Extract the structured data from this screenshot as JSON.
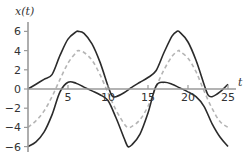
{
  "chart_data": {
    "type": "line",
    "title": "",
    "xlabel": "t",
    "ylabel": "x(t)",
    "xlim": [
      0,
      25
    ],
    "ylim": [
      -6,
      6
    ],
    "x_ticks": [
      5,
      10,
      15,
      20,
      25
    ],
    "y_ticks": [
      6,
      4,
      2,
      0,
      -2,
      -4,
      -6
    ],
    "grid": false,
    "legend": "none",
    "series": [
      {
        "name": "upper envelope",
        "style": "solid",
        "color": "#2b2b2b",
        "x": [
          0,
          1,
          2,
          3,
          4,
          5,
          6,
          6.3,
          7,
          8,
          9,
          10,
          10.5,
          11,
          12,
          13,
          14,
          15,
          16,
          17,
          18,
          18.6,
          19,
          20,
          21,
          22,
          22.5,
          23,
          24,
          25
        ],
        "y": [
          0,
          0.5,
          1.0,
          1.5,
          3.5,
          5.2,
          5.95,
          6,
          5.8,
          4.7,
          2.8,
          0.3,
          -0.7,
          -0.8,
          -0.4,
          0.2,
          0.7,
          1.2,
          1.9,
          3.8,
          5.5,
          6,
          5.9,
          4.9,
          3.0,
          0.5,
          -0.6,
          -0.8,
          -0.3,
          0.5
        ]
      },
      {
        "name": "signal",
        "style": "dashed",
        "color": "#b5b5b5",
        "x": [
          0,
          1,
          2,
          3,
          4,
          5,
          6,
          6.3,
          7,
          8,
          9,
          10,
          11,
          12,
          12.5,
          13,
          14,
          15,
          16,
          17,
          18,
          18.8,
          19,
          20,
          21,
          22,
          23,
          24,
          25
        ],
        "y": [
          -4,
          -3.3,
          -2.3,
          -0.8,
          1.0,
          2.7,
          3.8,
          4,
          3.8,
          3.0,
          1.5,
          -0.4,
          -2.2,
          -3.6,
          -4,
          -3.9,
          -3.2,
          -1.8,
          0.2,
          2.0,
          3.4,
          4,
          3.9,
          3.2,
          1.8,
          -0.2,
          -2.0,
          -3.4,
          -4
        ]
      },
      {
        "name": "lower envelope",
        "style": "solid",
        "color": "#2b2b2b",
        "x": [
          0,
          1,
          2,
          3,
          4,
          5,
          6,
          7,
          8,
          9,
          10,
          11,
          12,
          12.5,
          13,
          14,
          15,
          16,
          17,
          18,
          19,
          20,
          21,
          22,
          23,
          24,
          25
        ],
        "y": [
          -6,
          -5.5,
          -4.5,
          -2.7,
          -0.3,
          0.7,
          0.6,
          0.2,
          -0.2,
          -0.6,
          -1.2,
          -3.0,
          -5.1,
          -6,
          -5.8,
          -4.7,
          -2.5,
          0.3,
          0.7,
          0.5,
          0.1,
          -0.3,
          -0.8,
          -1.8,
          -3.6,
          -5.0,
          -6
        ]
      }
    ]
  },
  "axes": {
    "ylabel": "x(t)",
    "xlabel": "t",
    "x_tick_labels": [
      "5",
      "10",
      "15",
      "20",
      "25"
    ],
    "y_tick_labels": [
      "6",
      "4",
      "2",
      "0",
      "−2",
      "−4",
      "−6"
    ]
  }
}
